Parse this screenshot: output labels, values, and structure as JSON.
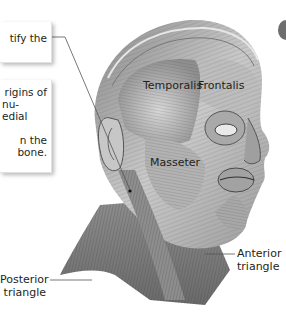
{
  "figure": {
    "type": "anatomical-illustration"
  },
  "callouts": [
    {
      "id": "callout-1",
      "lines": [
        "tify the"
      ]
    },
    {
      "id": "callout-2",
      "lines": [
        "rigins of",
        "nu-",
        "edial",
        "",
        "n the",
        "bone."
      ]
    }
  ],
  "labels": {
    "temporalis": "Temporalis",
    "frontalis": "Frontalis",
    "masseter": "Masseter",
    "posterior_triangle": [
      "Posterior",
      "triangle"
    ],
    "anterior_triangle": [
      "Anterior",
      "triangle"
    ]
  },
  "colors": {
    "text": "#231f20",
    "leader_line": "#555555",
    "muscle_light": "#d9d9d9",
    "muscle_mid": "#9a9a9a",
    "muscle_dark": "#4d4d4d",
    "background": "#ffffff"
  }
}
